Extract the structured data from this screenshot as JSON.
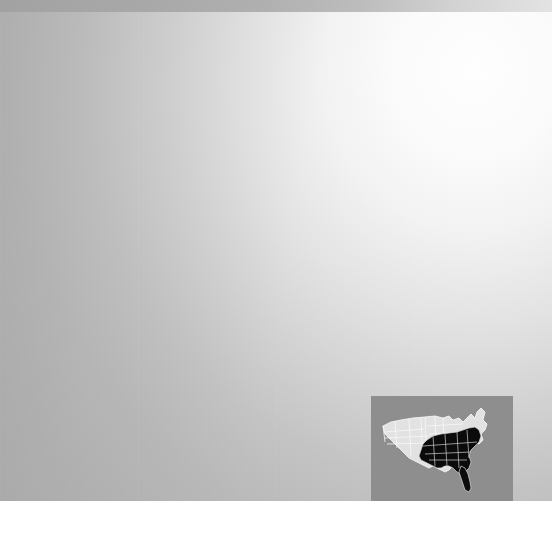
{
  "document": {
    "type": "choropleth-map",
    "title": "Eastern United States Region Map",
    "description": "Map of the eastern United States with southeastern states shaded dark and northern and northeastern states shaded light, over a gray gradient background, with a locator inset of the contiguous United States in the lower right."
  },
  "legend": {
    "highlight_label": "Highlighted region",
    "base_label": "Other states"
  },
  "colors": {
    "highlight_fill": "#585858",
    "base_fill": "#e7e7e7",
    "border_stroke": "#ffffff",
    "background_dark": "#aeaeae",
    "background_light": "#fefefe",
    "top_band": "#a8a8a8",
    "inset_panel": "#8e8e8e",
    "inset_base_fill": "#e2e2e2",
    "inset_highlight_fill": "#0b0b0b",
    "marker_fill": "#4a4a4a",
    "page_background": "#ffffff"
  },
  "main_map": {
    "name": "eastern-united-states",
    "highlighted_states": [
      "Louisiana",
      "Mississippi",
      "Alabama",
      "Georgia",
      "Florida",
      "South Carolina",
      "North Carolina",
      "Tennessee",
      "Kentucky",
      "Virginia",
      "West Virginia",
      "Maryland",
      "Delaware",
      "Arkansas",
      "Missouri"
    ],
    "base_states": [
      "Minnesota",
      "Wisconsin",
      "Michigan",
      "Iowa",
      "Illinois",
      "Indiana",
      "Ohio",
      "Pennsylvania",
      "New York",
      "New Jersey",
      "Connecticut",
      "Rhode Island",
      "Massachusetts",
      "Vermont",
      "New Hampshire",
      "Maine"
    ],
    "marker": {
      "label": "Location marker",
      "state": "Pennsylvania",
      "x": 268,
      "y": 180
    }
  },
  "inset_map": {
    "name": "contiguous-united-states-locator",
    "panel_label": "Locator inset",
    "highlighted_region_label": "Southeastern United States"
  }
}
